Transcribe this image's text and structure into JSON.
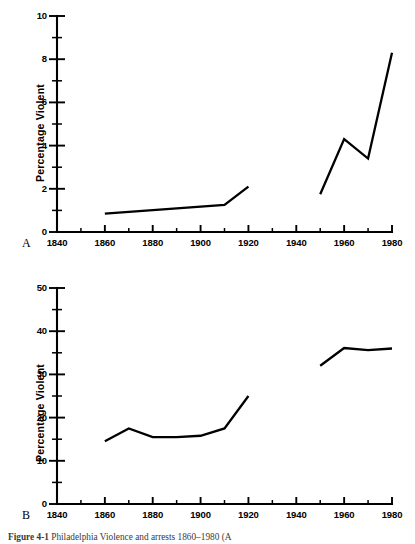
{
  "figure": {
    "caption_label": "Figure 4-1",
    "caption_text": "Philadelphia Violence and arrests 1860–1980 (A",
    "background_color": "#ffffff",
    "line_color": "#000000"
  },
  "panels": [
    {
      "id": "A",
      "letter": "A",
      "ylabel": "Percentage Violent",
      "xlabel": "",
      "y_ticks": [
        "0",
        "2",
        "4",
        "6",
        "8",
        "10"
      ],
      "x_ticks": [
        "1840",
        "1860",
        "1880",
        "1900",
        "1920",
        "1940",
        "1960",
        "1980"
      ]
    },
    {
      "id": "B",
      "letter": "B",
      "ylabel": "Percentage  Violent",
      "xlabel": "",
      "y_ticks": [
        "0",
        "10",
        "20",
        "30",
        "40",
        "50"
      ],
      "x_ticks": [
        "1840",
        "1860",
        "1880",
        "1900",
        "1920",
        "1940",
        "1960",
        "1980"
      ]
    }
  ],
  "chart_data": [
    {
      "type": "line",
      "title": "",
      "panel": "A",
      "xlabel": "",
      "ylabel": "Percentage Violent",
      "xlim": [
        1840,
        1980
      ],
      "ylim": [
        0,
        10
      ],
      "x_major_step": 20,
      "x_minor_step": 10,
      "y_major_step": 2,
      "y_minor_step": 1,
      "grid": false,
      "legend": "none",
      "series": [
        {
          "name": "early period",
          "x": [
            1860,
            1910,
            1920
          ],
          "values": [
            0.85,
            1.25,
            2.1
          ]
        },
        {
          "name": "late period",
          "x": [
            1950,
            1960,
            1970,
            1980
          ],
          "values": [
            1.75,
            4.3,
            3.4,
            8.3
          ]
        }
      ]
    },
    {
      "type": "line",
      "title": "",
      "panel": "B",
      "xlabel": "",
      "ylabel": "Percentage  Violent",
      "xlim": [
        1840,
        1980
      ],
      "ylim": [
        0,
        50
      ],
      "x_major_step": 20,
      "x_minor_step": 10,
      "y_major_step": 10,
      "y_minor_step": 5,
      "grid": false,
      "legend": "none",
      "series": [
        {
          "name": "early period",
          "x": [
            1860,
            1870,
            1880,
            1890,
            1900,
            1910,
            1920
          ],
          "values": [
            14.5,
            17.5,
            15.5,
            15.5,
            15.8,
            17.5,
            25.0
          ]
        },
        {
          "name": "late period",
          "x": [
            1950,
            1960,
            1970,
            1980
          ],
          "values": [
            32.0,
            36.1,
            35.6,
            36.0
          ]
        }
      ]
    }
  ]
}
